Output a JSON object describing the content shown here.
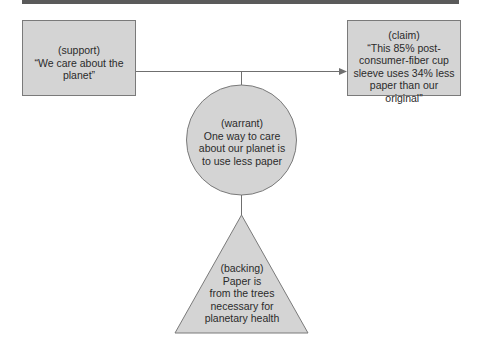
{
  "diagram": {
    "type": "toulmin-argument",
    "colors": {
      "fill": "#d4d4d4",
      "stroke": "#7a7a7a",
      "connector": "#6f6f6f",
      "top_bar": "#5a5a5a",
      "text": "#2b2b2b"
    },
    "nodes": {
      "support": {
        "shape": "rectangle",
        "label": "(support)",
        "lines": [
          "“We care about the",
          "planet”"
        ]
      },
      "claim": {
        "shape": "rectangle",
        "label": "(claim)",
        "lines": [
          "“This 85% post-",
          "consumer-fiber cup",
          "sleeve uses 34% less",
          "paper than our",
          "original”"
        ]
      },
      "warrant": {
        "shape": "circle",
        "label": "(warrant)",
        "lines": [
          "One way to care",
          "about our planet is",
          "to use less paper"
        ]
      },
      "backing": {
        "shape": "triangle",
        "label": "(backing)",
        "lines": [
          "Paper is",
          "from the trees",
          "necessary for",
          "planetary health"
        ]
      }
    },
    "edges": [
      {
        "from": "support",
        "to": "claim",
        "arrow": true
      },
      {
        "from": "warrant",
        "to": "support-claim-line",
        "arrow": false
      },
      {
        "from": "backing",
        "to": "warrant",
        "arrow": false
      }
    ]
  }
}
